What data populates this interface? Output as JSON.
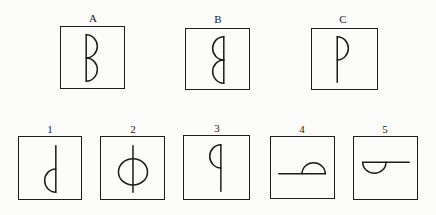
{
  "puzzle": {
    "type": "visual-analogy-matrix",
    "background_color": "#fbfbfa",
    "ink_color": "#1c1c1c",
    "prompt_row": {
      "name": "problem-row",
      "panels": [
        {
          "label": "A",
          "figure_name": "letter-b-glyph",
          "description": "vertical stem on left with two semicircles bulging right",
          "box": {
            "x": 60,
            "y": 26,
            "w": 65,
            "h": 63
          },
          "label_pos": {
            "x": 81,
            "y": 12
          }
        },
        {
          "label": "B",
          "figure_name": "mirrored-letter-b-glyph",
          "description": "vertical stem on right with two semicircles bulging left",
          "box": {
            "x": 185,
            "y": 28,
            "w": 65,
            "h": 62
          },
          "label_pos": {
            "x": 206,
            "y": 13
          }
        },
        {
          "label": "C",
          "figure_name": "letter-p-glyph",
          "description": "vertical stem on left with one semicircle bulging right at top, stem extends below",
          "box": {
            "x": 311,
            "y": 28,
            "w": 67,
            "h": 62
          },
          "label_pos": {
            "x": 331,
            "y": 13
          }
        }
      ]
    },
    "answer_row": {
      "name": "answer-options-row",
      "panels": [
        {
          "label": "1",
          "figure_name": "letter-d-glyph",
          "description": "vertical stem on right with one semicircle bulging left at bottom, stem extends above",
          "box": {
            "x": 18,
            "y": 136,
            "w": 64,
            "h": 64
          },
          "label_pos": {
            "x": 38,
            "y": 123
          }
        },
        {
          "label": "2",
          "figure_name": "circle-with-vertical-line-glyph",
          "description": "full circle with a vertical line through it extending above and below",
          "box": {
            "x": 100,
            "y": 136,
            "w": 65,
            "h": 64
          },
          "label_pos": {
            "x": 121,
            "y": 123
          }
        },
        {
          "label": "3",
          "figure_name": "letter-q-glyph",
          "description": "vertical stem on right with one semicircle bulging left at top, stem extends below",
          "box": {
            "x": 183,
            "y": 135,
            "w": 67,
            "h": 65
          },
          "label_pos": {
            "x": 205,
            "y": 122
          }
        },
        {
          "label": "4",
          "figure_name": "horizontal-line-with-upward-semicircle-glyph",
          "description": "horizontal line with a semicircle bulging upward, line extends to the left",
          "box": {
            "x": 270,
            "y": 136,
            "w": 65,
            "h": 63
          },
          "label_pos": {
            "x": 290,
            "y": 123
          }
        },
        {
          "label": "5",
          "figure_name": "horizontal-line-with-downward-semicircle-glyph",
          "description": "horizontal line with a semicircle bulging downward, line extends to the right",
          "box": {
            "x": 353,
            "y": 136,
            "w": 65,
            "h": 64
          },
          "label_pos": {
            "x": 373,
            "y": 123
          }
        }
      ]
    }
  }
}
